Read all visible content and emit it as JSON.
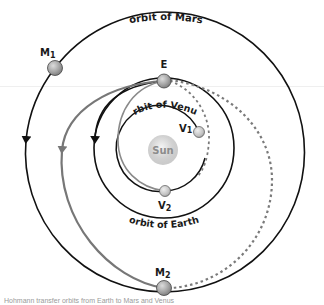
{
  "diagram": {
    "sun": {
      "label": "Sun",
      "cx": 163,
      "cy": 150,
      "r": 14
    },
    "orbits": [
      {
        "id": "venus",
        "label": "orbit of Venus",
        "cx": 163,
        "cy": 150,
        "r": 43
      },
      {
        "id": "earth",
        "label": "orbit of Earth",
        "cx": 164,
        "cy": 148,
        "r": 70
      },
      {
        "id": "mars",
        "label": "orbit of Mars",
        "cx": 165,
        "cy": 152,
        "r": 140
      }
    ],
    "bodies": [
      {
        "id": "E",
        "label": "E",
        "sub": "",
        "cx": 164,
        "cy": 81
      },
      {
        "id": "M1",
        "label": "M",
        "sub": "1",
        "cx": 55,
        "cy": 68
      },
      {
        "id": "M2",
        "label": "M",
        "sub": "2",
        "cx": 164,
        "cy": 288
      },
      {
        "id": "V1",
        "label": "V",
        "sub": "1",
        "cx": 199,
        "cy": 132
      },
      {
        "id": "V2",
        "label": "V",
        "sub": "2",
        "cx": 165,
        "cy": 191
      }
    ],
    "paths": [
      {
        "id": "earth-to-mars-transfer",
        "style": "solid",
        "color": "#6e6e6e"
      },
      {
        "id": "earth-to-venus-transfer",
        "style": "solid",
        "color": "#8a8a8a"
      },
      {
        "id": "earth-to-mars-return",
        "style": "dashed",
        "color": "#7a7a7a"
      },
      {
        "id": "earth-to-venus-return",
        "style": "dashed",
        "color": "#7a7a7a"
      }
    ],
    "colors": {
      "orbit_line": "#111111",
      "planet_fill": "#a8a8a8",
      "sun_fill": "#d4d4d4",
      "transfer_gray": "#777777"
    },
    "caption": "Hohmann transfer orbits from Earth to Mars and Venus"
  }
}
